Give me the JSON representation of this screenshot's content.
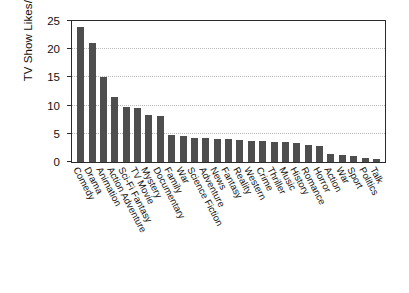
{
  "chart_data": {
    "type": "bar",
    "title": "",
    "xlabel": "",
    "ylabel": "TV Show Likes/# of Users",
    "ylim": [
      0,
      25
    ],
    "yticks": [
      0,
      5,
      10,
      15,
      20,
      25
    ],
    "ytick_labels": [
      "0",
      "5",
      "10",
      "15",
      "20",
      "25"
    ],
    "grid": true,
    "legend": null,
    "bar_color": "#4e4e4e",
    "axis_color": "#2b2b2b",
    "categories": [
      "Comedy",
      "Drama",
      "Animation",
      "Action Adventure",
      "Sci-Fi Fantasy",
      "TV Movie",
      "Mystery",
      "Documentary",
      "Family",
      "War",
      "Science Fiction",
      "Adventure",
      "News",
      "Fantasy",
      "Reality",
      "Western",
      "Crime",
      "Thriller",
      "Music",
      "History",
      "Romance",
      "Horror",
      "Action",
      "War",
      "Sport",
      "Politics",
      "Talk"
    ],
    "values": [
      24.0,
      21.1,
      15.1,
      11.5,
      9.8,
      9.5,
      8.4,
      8.2,
      4.8,
      4.6,
      4.3,
      4.2,
      4.1,
      4.0,
      3.9,
      3.8,
      3.7,
      3.6,
      3.5,
      3.3,
      3.1,
      2.9,
      1.4,
      1.2,
      1.0,
      0.8,
      0.6
    ]
  }
}
